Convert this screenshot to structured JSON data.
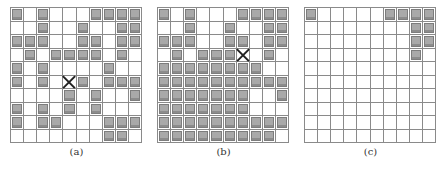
{
  "figure": {
    "panels": [
      {
        "label": "(a)",
        "x": 10,
        "mark": [
          5,
          4
        ],
        "grid": [
          [
            1,
            0,
            1,
            0,
            0,
            0,
            1,
            1,
            1,
            1
          ],
          [
            0,
            0,
            1,
            0,
            0,
            1,
            0,
            0,
            1,
            1
          ],
          [
            1,
            1,
            1,
            0,
            0,
            1,
            1,
            0,
            1,
            1
          ],
          [
            0,
            1,
            0,
            1,
            1,
            1,
            1,
            0,
            1,
            0
          ],
          [
            1,
            0,
            1,
            0,
            0,
            0,
            0,
            1,
            0,
            0
          ],
          [
            1,
            0,
            1,
            0,
            0,
            1,
            0,
            1,
            1,
            1
          ],
          [
            0,
            0,
            0,
            0,
            1,
            0,
            1,
            0,
            0,
            1
          ],
          [
            1,
            0,
            1,
            0,
            1,
            0,
            1,
            0,
            0,
            0
          ],
          [
            1,
            0,
            1,
            1,
            0,
            0,
            0,
            1,
            1,
            1
          ],
          [
            0,
            0,
            0,
            0,
            0,
            0,
            0,
            1,
            1,
            0
          ]
        ]
      },
      {
        "label": "(b)",
        "x": 157,
        "mark": [
          3,
          6
        ],
        "grid": [
          [
            1,
            0,
            1,
            0,
            0,
            0,
            1,
            1,
            1,
            1
          ],
          [
            0,
            0,
            1,
            0,
            0,
            1,
            0,
            0,
            1,
            1
          ],
          [
            1,
            1,
            1,
            0,
            0,
            1,
            1,
            0,
            1,
            1
          ],
          [
            0,
            1,
            0,
            1,
            1,
            1,
            0,
            0,
            1,
            0
          ],
          [
            1,
            1,
            1,
            1,
            1,
            1,
            1,
            1,
            0,
            0
          ],
          [
            1,
            1,
            1,
            1,
            1,
            1,
            1,
            1,
            1,
            1
          ],
          [
            1,
            1,
            1,
            1,
            1,
            1,
            1,
            0,
            0,
            1
          ],
          [
            1,
            1,
            1,
            1,
            1,
            1,
            1,
            0,
            0,
            0
          ],
          [
            1,
            1,
            1,
            1,
            1,
            1,
            1,
            1,
            1,
            1
          ],
          [
            1,
            1,
            1,
            1,
            1,
            1,
            1,
            1,
            1,
            0
          ]
        ]
      },
      {
        "label": "(c)",
        "x": 304,
        "mark": null,
        "grid": [
          [
            1,
            0,
            0,
            0,
            0,
            0,
            1,
            1,
            1,
            1
          ],
          [
            0,
            0,
            0,
            0,
            0,
            0,
            0,
            0,
            1,
            1
          ],
          [
            0,
            0,
            0,
            0,
            0,
            0,
            0,
            0,
            1,
            1
          ],
          [
            0,
            0,
            0,
            0,
            0,
            0,
            0,
            0,
            1,
            0
          ],
          [
            0,
            0,
            0,
            0,
            0,
            0,
            0,
            0,
            0,
            0
          ],
          [
            0,
            0,
            0,
            0,
            0,
            0,
            0,
            0,
            0,
            0
          ],
          [
            0,
            0,
            0,
            0,
            0,
            0,
            0,
            0,
            0,
            0
          ],
          [
            0,
            0,
            0,
            0,
            0,
            0,
            0,
            0,
            0,
            0
          ],
          [
            0,
            0,
            0,
            0,
            0,
            0,
            0,
            0,
            0,
            0
          ],
          [
            0,
            0,
            0,
            0,
            0,
            0,
            0,
            0,
            0,
            0
          ]
        ]
      }
    ]
  }
}
